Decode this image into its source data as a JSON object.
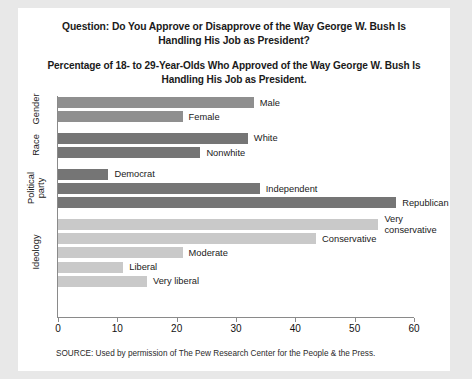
{
  "titles": {
    "question": "Question: Do You Approve or Disapprove of the Way George W. Bush Is Handling His Job as President?",
    "subtitle": "Percentage of 18- to 29-Year-Olds Who Approved of the Way George W. Bush Is Handling His Job as President."
  },
  "source": "SOURCE: Used by permission of The Pew Research Center for the People & the Press.",
  "chart_data": {
    "type": "bar",
    "orientation": "horizontal",
    "title": "Percentage of 18- to 29-Year-Olds Who Approved of the Way George W. Bush Is Handling His Job as President.",
    "xlabel": "",
    "ylabel": "",
    "xlim": [
      0,
      60
    ],
    "xticks": [
      0,
      10,
      20,
      30,
      40,
      50,
      60
    ],
    "grid": false,
    "legend": "none",
    "groups": [
      {
        "name": "Gender",
        "color": "#8f8f8f",
        "categories": [
          "Male",
          "Female"
        ],
        "values": [
          33,
          21
        ]
      },
      {
        "name": "Race",
        "color": "#757575",
        "categories": [
          "White",
          "Nonwhite"
        ],
        "values": [
          32,
          24
        ]
      },
      {
        "name": "Political party",
        "color": "#757575",
        "categories": [
          "Democrat",
          "Independent",
          "Republican"
        ],
        "values": [
          8.5,
          34,
          57
        ]
      },
      {
        "name": "Ideology",
        "color": "#c9c9c9",
        "categories": [
          "Very conservative",
          "Conservative",
          "Moderate",
          "Liberal",
          "Very liberal"
        ],
        "values": [
          54,
          43.5,
          21,
          11,
          15
        ]
      }
    ],
    "categories": [
      "Male",
      "Female",
      "White",
      "Nonwhite",
      "Democrat",
      "Independent",
      "Republican",
      "Very conservative",
      "Conservative",
      "Moderate",
      "Liberal",
      "Very liberal"
    ],
    "values": [
      33,
      21,
      32,
      24,
      8.5,
      34,
      57,
      54,
      43.5,
      21,
      11,
      15
    ]
  },
  "colors": {
    "background": "#e8e8e8",
    "panel": "#ffffff",
    "axis": "#8a8a8a",
    "gender_bar": "#8f8f8f",
    "race_bar": "#757575",
    "party_bar": "#757575",
    "ideology_bar": "#c9c9c9"
  }
}
